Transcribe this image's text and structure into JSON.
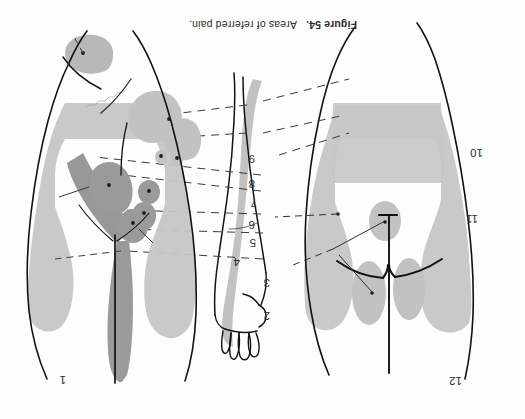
{
  "page": {
    "background_color": "#fdfdfd",
    "width": 525,
    "height": 419,
    "orientation_note": "plate printed upside-down"
  },
  "caption": {
    "figure_number": "Figure 54.",
    "text": "Areas of referred pain.",
    "full": "Figure 54.  Areas of referred pain."
  },
  "annotation": {
    "handwritten_note": "illegible"
  },
  "colors": {
    "ink": "#1d1d1d",
    "outline": "#111111",
    "shade_light": "#c9c9c9",
    "shade_mid": "#b4b4b4",
    "shade_dark": "#9a9a9a",
    "shade_darker": "#868686",
    "leader_line": "#3a3a3a",
    "label_text": "#2e2e2e",
    "background": "#fdfdfd"
  },
  "labels": [
    {
      "id": "l1",
      "text": "1",
      "x": 62,
      "y": 380,
      "figure": "left-posterior"
    },
    {
      "id": "l2",
      "text": "2",
      "x": 266,
      "y": 316,
      "figure": "center"
    },
    {
      "id": "l3",
      "text": "3",
      "x": 266,
      "y": 283,
      "figure": "center"
    },
    {
      "id": "l4",
      "text": "4",
      "x": 236,
      "y": 262,
      "figure": "center"
    },
    {
      "id": "l5",
      "text": "5",
      "x": 252,
      "y": 243,
      "figure": "center"
    },
    {
      "id": "l6",
      "text": "6",
      "x": 251,
      "y": 225,
      "figure": "center"
    },
    {
      "id": "l7",
      "text": "7",
      "x": 253,
      "y": 203,
      "figure": "center"
    },
    {
      "id": "l8",
      "text": "8",
      "x": 251,
      "y": 184,
      "figure": "center"
    },
    {
      "id": "l9",
      "text": "9",
      "x": 251,
      "y": 159,
      "figure": "center"
    },
    {
      "id": "l10",
      "text": "10",
      "x": 477,
      "y": 153,
      "figure": "right-anterior"
    },
    {
      "id": "l11",
      "text": "11",
      "x": 472,
      "y": 219,
      "figure": "right-anterior"
    },
    {
      "id": "l12",
      "text": "12",
      "x": 456,
      "y": 381,
      "figure": "right-anterior"
    }
  ],
  "figures": {
    "left": {
      "name": "posterior-torso",
      "description": "posterior trunk with shaded referred pain areas over flanks, lower back and sacrum"
    },
    "right": {
      "name": "anterior-torso",
      "description": "anterior trunk with shaded referred pain areas over chest, epigastrium and groin"
    },
    "center": {
      "name": "arm-and-hand",
      "description": "left arm and hand with shaded ulnar band of referred pain"
    }
  }
}
